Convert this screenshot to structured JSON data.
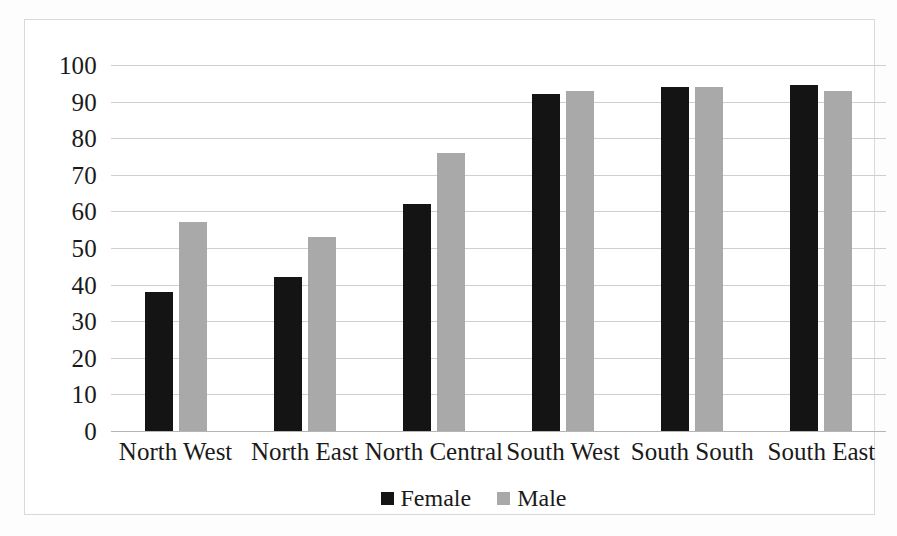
{
  "chart_data": {
    "type": "bar",
    "title": "",
    "subtitle": "",
    "xlabel": "",
    "ylabel": "",
    "ylim": [
      0,
      100
    ],
    "ytick_step": 10,
    "yticks": [
      100,
      90,
      80,
      70,
      60,
      50,
      40,
      30,
      20,
      10,
      0
    ],
    "grid": true,
    "legend_position": "bottom-center",
    "categories": [
      "North West",
      "North East",
      "North Central",
      "South West",
      "South South",
      "South East"
    ],
    "series": [
      {
        "name": "Female",
        "color": "#141414",
        "values": [
          38,
          42,
          62,
          92,
          94,
          94.5
        ]
      },
      {
        "name": "Male",
        "color": "#a9a9a9",
        "values": [
          57,
          53,
          76,
          93,
          94,
          93
        ]
      }
    ],
    "annotations": []
  },
  "legend": {
    "items": [
      {
        "label": "Female",
        "swatch": "legend-swatch-female"
      },
      {
        "label": "Male",
        "swatch": "legend-swatch-male"
      }
    ]
  },
  "colors": {
    "female_bar": "#141414",
    "male_bar": "#a9a9a9",
    "gridline": "#cfcfcf",
    "frame": "#d9d9d9",
    "text": "#1a1a1a",
    "background": "#ffffff"
  }
}
